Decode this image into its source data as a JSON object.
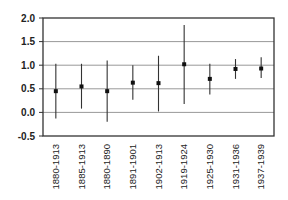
{
  "chart_data": {
    "type": "scatter",
    "subtype": "error-bar",
    "title": "",
    "xlabel": "",
    "ylabel": "",
    "ylim": [
      -0.5,
      2.0
    ],
    "yticks": [
      -0.5,
      0.0,
      0.5,
      1.0,
      1.5,
      2.0
    ],
    "ytick_labels": [
      "-0.5",
      "0.0",
      "0.5",
      "1.0",
      "1.5",
      "2.0"
    ],
    "grid": {
      "horizontal": true,
      "vertical": false
    },
    "legend": null,
    "categories": [
      "1880-1913",
      "1885-1913",
      "1880-1890",
      "1891-1901",
      "1902-1913",
      "1919-1924",
      "1925-1930",
      "1931-1936",
      "1937-1939"
    ],
    "series": [
      {
        "name": "estimate",
        "values": [
          0.45,
          0.55,
          0.45,
          0.63,
          0.62,
          1.02,
          0.71,
          0.92,
          0.93
        ],
        "upper": [
          1.03,
          1.03,
          1.1,
          1.0,
          1.2,
          1.85,
          1.03,
          1.13,
          1.17
        ],
        "lower": [
          -0.13,
          0.08,
          -0.2,
          0.27,
          0.02,
          0.18,
          0.38,
          0.71,
          0.73
        ]
      }
    ],
    "colors": {
      "marker": "#111111",
      "errorbar": "#333333",
      "grid": "#999999",
      "axis": "#333333"
    }
  }
}
